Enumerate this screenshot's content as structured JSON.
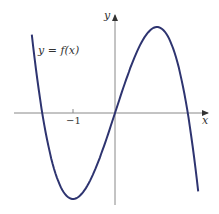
{
  "chart_data": {
    "type": "line",
    "title": "",
    "function_label": "y = f(x)",
    "xlabel": "x",
    "ylabel": "y",
    "x_ticks": [
      {
        "value": -1,
        "label": "−1"
      }
    ],
    "xlim": [
      -2.0,
      2.4
    ],
    "ylim": [
      -2.0,
      2.5
    ],
    "grid": false,
    "series": [
      {
        "name": "f(x)",
        "color": "#2e3470",
        "x": [
          -1.95,
          -1.73,
          -1.5,
          -1.0,
          -0.5,
          0,
          0.5,
          1.0,
          1.5,
          1.73,
          1.95
        ],
        "y": [
          1.57,
          0,
          -1.13,
          -2.0,
          -1.38,
          0,
          1.38,
          2.0,
          1.13,
          0,
          -1.57
        ]
      }
    ]
  },
  "labels": {
    "function": "y = f(x)",
    "x_axis": "x",
    "y_axis": "y",
    "tick_neg1": "−1"
  }
}
